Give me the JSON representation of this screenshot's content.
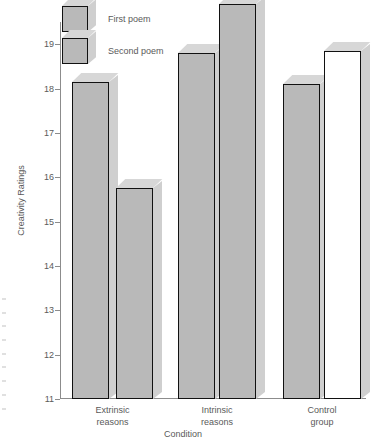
{
  "chart_data": {
    "type": "bar",
    "title": "",
    "xlabel": "Condition",
    "ylabel": "Creativity Ratings",
    "ylim": [
      11,
      19
    ],
    "yticks": [
      11,
      12,
      13,
      14,
      15,
      16,
      17,
      18,
      19
    ],
    "grid": false,
    "legend_position": "top-left",
    "categories": [
      "Extrinsic reasons",
      "Intrinsic reasons",
      "Control group"
    ],
    "category_lines": [
      [
        "Extrinsic",
        "reasons"
      ],
      [
        "Intrinsic",
        "reasons"
      ],
      [
        "Control",
        "group"
      ]
    ],
    "series": [
      {
        "name": "First poem",
        "values": [
          18.15,
          18.8,
          18.1
        ]
      },
      {
        "name": "Second poem",
        "values": [
          15.75,
          19.9,
          18.85
        ]
      }
    ]
  },
  "legend": {
    "items": [
      {
        "label": "First poem",
        "icon": "cube-swatch-icon",
        "fill": "#b9b9b9"
      },
      {
        "label": "Second poem",
        "icon": "cube-swatch-icon",
        "fill": "#b9b9b9"
      }
    ]
  },
  "axes": {
    "y_title": "Creativity Ratings",
    "x_title": "Condition",
    "y_tick_labels": [
      "19",
      "18",
      "17",
      "16",
      "15",
      "14",
      "13",
      "12",
      "11"
    ]
  },
  "colors": {
    "bar_fill": "#b9b9b9",
    "bar_fill_hollow": "#ffffff",
    "bar_top": "#d7d7d7",
    "bar_side": "#cfcfcf",
    "bar_outline": "#111111",
    "axis": "#8c8c8c",
    "text": "#5a5a5a",
    "background": "#ffffff"
  }
}
